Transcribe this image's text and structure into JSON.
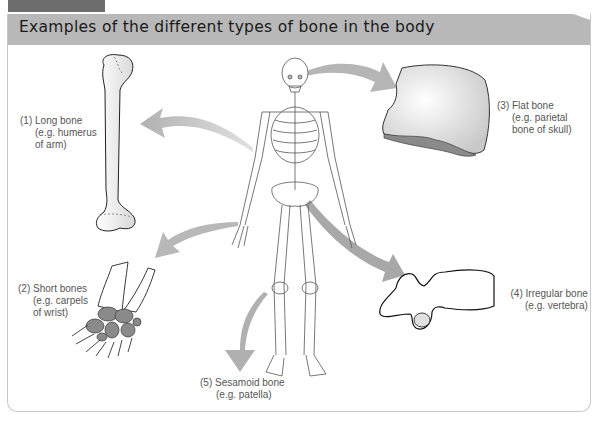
{
  "header": {
    "tab_label": "Figure 3.8",
    "title": "Examples of the different types of bone in the body"
  },
  "bones": [
    {
      "number": "(1)",
      "name": "Long bone",
      "example_line1": "(e.g. humerus",
      "example_line2": "of arm)"
    },
    {
      "number": "(2)",
      "name": "Short bones",
      "example_line1": "(e.g. carpels",
      "example_line2": "of wrist)"
    },
    {
      "number": "(3)",
      "name": "Flat bone",
      "example_line1": "(e.g. parietal",
      "example_line2": "bone of skull)"
    },
    {
      "number": "(4)",
      "name": "Irregular bone",
      "example_line1": "(e.g. vertebra)"
    },
    {
      "number": "(5)",
      "name": "Sesamoid bone",
      "example_line1": "(e.g. patella)"
    }
  ],
  "colors": {
    "title_bar": "#b8b8b8",
    "tab": "#6d6d6d",
    "arrow": "#b0b0b0",
    "carpal_fill": "#8a8a8a",
    "frame": "#c8c8c8"
  }
}
